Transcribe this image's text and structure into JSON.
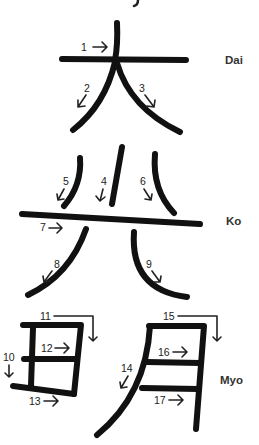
{
  "diagram": {
    "type": "kanji-stroke-order",
    "characters": [
      {
        "kanji": "大",
        "reading": "Dai",
        "strokes": [
          "1",
          "2",
          "3"
        ]
      },
      {
        "kanji": "興",
        "reading": "Ko",
        "strokes": [
          "4",
          "5",
          "6",
          "7",
          "8",
          "9"
        ]
      },
      {
        "kanji": "明",
        "reading": "Myo",
        "strokes": [
          "10",
          "11",
          "12",
          "13",
          "14",
          "15",
          "16",
          "17"
        ]
      }
    ],
    "labels": {
      "dai": "Dai",
      "ko": "Ko",
      "myo": "Myo"
    },
    "stroke_numbers": {
      "s1": "1",
      "s2": "2",
      "s3": "3",
      "s4": "4",
      "s5": "5",
      "s6": "6",
      "s7": "7",
      "s8": "8",
      "s9": "9",
      "s10": "10",
      "s11": "11",
      "s12": "12",
      "s13": "13",
      "s14": "14",
      "s15": "15",
      "s16": "16",
      "s17": "17"
    },
    "colors": {
      "stroke": "#111111",
      "text": "#333333",
      "background": "#ffffff"
    }
  }
}
